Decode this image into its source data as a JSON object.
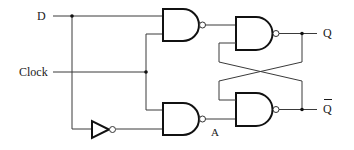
{
  "diagram": {
    "labels": {
      "d": "D",
      "clock": "Clock",
      "q": "Q",
      "q_bar": "Q",
      "node_a": "A"
    },
    "components": [
      {
        "id": "nand-1",
        "type": "NAND",
        "inputs": [
          "D",
          "Clock"
        ],
        "output": "S"
      },
      {
        "id": "nand-2",
        "type": "NAND",
        "inputs": [
          "Clock",
          "NOT D"
        ],
        "output": "A"
      },
      {
        "id": "not-1",
        "type": "NOT",
        "inputs": [
          "D"
        ],
        "output": "NOT D"
      },
      {
        "id": "nand-3",
        "type": "NAND",
        "inputs": [
          "S",
          "Q-bar"
        ],
        "output": "Q"
      },
      {
        "id": "nand-4",
        "type": "NAND",
        "inputs": [
          "A",
          "Q"
        ],
        "output": "Q-bar"
      }
    ],
    "colors": {
      "line": "#3a3a3a",
      "gate_outline": "#111111",
      "background": "#ffffff"
    }
  }
}
